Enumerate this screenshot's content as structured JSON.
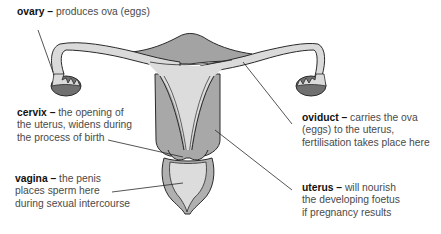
{
  "colors": {
    "background": "#ffffff",
    "tissue_dark": "#9a9a9a",
    "tissue_mid": "#b5b5b5",
    "tissue_light": "#dcdcdc",
    "ovary_dark": "#6e6e6e",
    "outline": "#2a2a2a",
    "text": "#4a4a4a",
    "term": "#111111"
  },
  "labels": {
    "ovary": {
      "term": "ovary",
      "dash": " – ",
      "lines": [
        "produces ova (eggs)"
      ]
    },
    "cervix": {
      "term": "cervix",
      "dash": " – ",
      "lines": [
        "the opening of",
        "the uterus, widens during",
        "the process of birth"
      ]
    },
    "vagina": {
      "term": "vagina",
      "dash": " – ",
      "lines": [
        "the penis",
        "places sperm here",
        "during sexual intercourse"
      ]
    },
    "oviduct": {
      "term": "oviduct",
      "dash": " – ",
      "lines": [
        "carries the ova",
        "(eggs) to the uterus,",
        "fertilisation takes place here"
      ]
    },
    "uterus": {
      "term": "uterus",
      "dash": " – ",
      "lines": [
        "will nourish",
        "the developing foetus",
        "if pregnancy results"
      ]
    }
  }
}
